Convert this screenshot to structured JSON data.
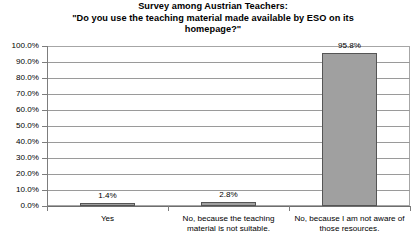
{
  "chart_data": {
    "type": "bar",
    "title": "Survey among Austrian Teachers: \"Do you use the teaching material made available by ESO on its homepage?\"",
    "title_lines": [
      "Survey among Austrian Teachers:",
      "\"Do you use the teaching material made available by ESO on its homepage?\""
    ],
    "categories": [
      "Yes",
      "No, because the teaching material is not suitable.",
      "No, because I am not aware of those resources."
    ],
    "category_label_lines": [
      [
        "Yes"
      ],
      [
        "No, because the teaching",
        "material is not suitable."
      ],
      [
        "No, because I am not aware of",
        "those resources."
      ]
    ],
    "values": [
      1.4,
      2.8,
      95.8
    ],
    "value_labels": [
      "1.4%",
      "2.8%",
      "95.8%"
    ],
    "xlabel": "",
    "ylabel": "",
    "ylim": [
      0,
      100
    ],
    "ytick_values": [
      0,
      10,
      20,
      30,
      40,
      50,
      60,
      70,
      80,
      90,
      100
    ],
    "ytick_labels": [
      "0.0%",
      "10.0%",
      "20.0%",
      "30.0%",
      "40.0%",
      "50.0%",
      "60.0%",
      "70.0%",
      "80.0%",
      "90.0%",
      "100.0%"
    ],
    "grid": true,
    "grid_axis": "y",
    "legend": false,
    "legend_position": "none",
    "bar_fill_color": "#a0a0a0",
    "bar_border_color": "#555555",
    "plot_background": "#ffffff",
    "gridline_color": "#9a9a9a",
    "axis_color": "#7d7d7d",
    "text_color": "#000000"
  }
}
